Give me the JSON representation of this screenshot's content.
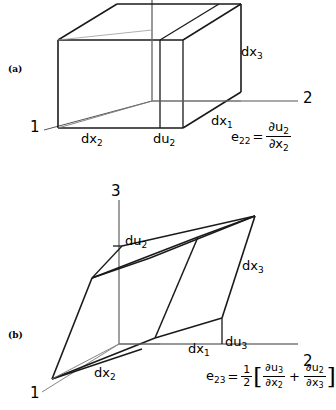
{
  "figure": {
    "panels": [
      {
        "tag": "(a)",
        "kind": "normal-strain-cube",
        "description": "Rectangular parallelepiped element elongated along axis 2 showing normal strain",
        "axes": [
          {
            "name": "axis-1",
            "label": "1",
            "direction": "down-left"
          },
          {
            "name": "axis-2",
            "label": "2",
            "direction": "right"
          },
          {
            "name": "axis-3",
            "label": "3",
            "direction": "up"
          }
        ],
        "dimension_labels": [
          {
            "name": "dx3",
            "text": "dx",
            "sub": "3"
          },
          {
            "name": "dx1",
            "text": "dx",
            "sub": "1"
          },
          {
            "name": "dx2",
            "text": "dx",
            "sub": "2"
          },
          {
            "name": "du2",
            "text": "du",
            "sub": "2"
          }
        ],
        "equation": {
          "lhs_base": "e",
          "lhs_sub": "22",
          "equals": "=",
          "numerator_base": "∂u",
          "numerator_sub": "2",
          "denominator_base": "∂x",
          "denominator_sub": "2"
        }
      },
      {
        "tag": "(b)",
        "kind": "shear-strain-parallelepiped",
        "description": "Sheared element showing shear strain in the 2-3 plane",
        "axes": [
          {
            "name": "axis-1",
            "label": "1",
            "direction": "down-left"
          },
          {
            "name": "axis-2",
            "label": "2",
            "direction": "right"
          },
          {
            "name": "axis-3",
            "label": "3",
            "direction": "up"
          }
        ],
        "dimension_labels": [
          {
            "name": "du2",
            "text": "du",
            "sub": "2"
          },
          {
            "name": "dx3",
            "text": "dx",
            "sub": "3"
          },
          {
            "name": "dx1",
            "text": "dx",
            "sub": "1"
          },
          {
            "name": "du3",
            "text": "du",
            "sub": "3"
          },
          {
            "name": "dx2",
            "text": "dx",
            "sub": "2"
          }
        ],
        "equation": {
          "lhs_base": "e",
          "lhs_sub": "23",
          "equals": "=",
          "factor_num": "1",
          "factor_den": "2",
          "bracket_open": "[",
          "bracket_close": "]",
          "term1_num_base": "∂u",
          "term1_num_sub": "3",
          "term1_den_base": "∂x",
          "term1_den_sub": "2",
          "operator": "+",
          "term2_num_base": "∂u",
          "term2_num_sub": "2",
          "term2_den_base": "∂x",
          "term2_den_sub": "3"
        }
      }
    ],
    "colors": {
      "line": "#1a1a1a",
      "axis_line": "#555555",
      "background": "#ffffff"
    }
  }
}
